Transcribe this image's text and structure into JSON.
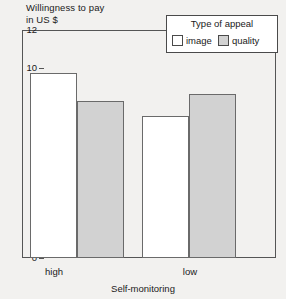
{
  "chart_data": {
    "type": "bar",
    "title": "",
    "ylabel": "Willingness to pay\nin US $",
    "ylabel_line1": "Willingness to pay",
    "ylabel_line2": "in US $",
    "xlabel": "Self-monitoring",
    "categories": [
      "high",
      "low"
    ],
    "ylim": [
      0,
      12
    ],
    "yticks": [
      0,
      2,
      4,
      6,
      8,
      10,
      12
    ],
    "ytick_labels": [
      "0",
      "2",
      "4",
      "6",
      "8",
      "10",
      "12"
    ],
    "grid": false,
    "legend_position": "top-right",
    "legend_title": "Type of appeal",
    "series": [
      {
        "name": "image",
        "values": [
          9.75,
          7.5
        ],
        "color": "#ffffff"
      },
      {
        "name": "quality",
        "values": [
          8.25,
          8.65
        ],
        "color": "#d2d2d2"
      }
    ]
  },
  "legend": {
    "title": "Type of appeal",
    "entries": [
      {
        "label": "image",
        "color": "#ffffff"
      },
      {
        "label": "quality",
        "color": "#d2d2d2"
      }
    ]
  },
  "axes": {
    "y_title_line1": "Willingness to pay",
    "y_title_line2": "in US $",
    "x_title": "Self-monitoring",
    "y_ticks": [
      "12",
      "10",
      "8",
      "6",
      "4",
      "2",
      "0"
    ],
    "x_ticks": [
      "high",
      "low"
    ]
  },
  "colors": {
    "background": "#f2f1ef",
    "axis": "#555555",
    "bar_border": "#6a6a6a",
    "image_fill": "#ffffff",
    "quality_fill": "#d2d2d2"
  }
}
